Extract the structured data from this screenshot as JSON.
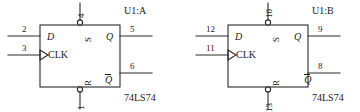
{
  "diagram": {
    "type": "schematic",
    "flipflops": [
      {
        "reference": "U1:A",
        "part": "74LS74",
        "ports": {
          "d": "D",
          "clk": "CLK",
          "set": "S",
          "reset": "R",
          "q": "Q",
          "qbar": "Q"
        },
        "pins": {
          "d": "2",
          "clk": "3",
          "set": "4",
          "reset": "1",
          "q": "5",
          "qbar": "6"
        }
      },
      {
        "reference": "U1:B",
        "part": "74LS74",
        "ports": {
          "d": "D",
          "clk": "CLK",
          "set": "S",
          "reset": "R",
          "q": "Q",
          "qbar": "Q"
        },
        "pins": {
          "d": "12",
          "clk": "11",
          "set": "10",
          "reset": "13",
          "q": "9",
          "qbar": "8"
        }
      }
    ],
    "colors": {
      "line": "#2b2b2b",
      "text": "#1a1a1a",
      "background": "#ffffff"
    }
  }
}
